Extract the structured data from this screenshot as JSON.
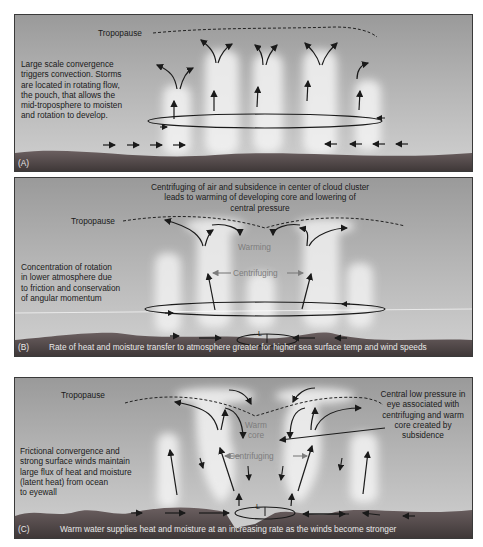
{
  "figure": {
    "colors": {
      "sky_top": "#9a9a9a",
      "sky_bottom": "#cfcfcf",
      "ocean": "#5a5050",
      "cloud": "#f2f2f2",
      "arrow": "#1a1a1a",
      "grey_label": "#7d7d7d",
      "caption_text": "#e8e8e8"
    }
  },
  "panels": [
    {
      "id": "A",
      "label": "(A)",
      "tropopause_label": "Tropopause",
      "description": "Large scale convergence\ntriggers convection. Storms\nare located in rotating flow,\nthe pouch, that allows the\nmid-troposphere to moisten\nand rotation to develop.",
      "caption": ""
    },
    {
      "id": "B",
      "label": "(B)",
      "tropopause_label": "Tropopause",
      "top_note": "Centrifuging of air and subsidence in center of cloud cluster\nleads to warming of developing core and lowering of\ncentral pressure",
      "description": "Concentration of rotation\nin lower atmosphere due\nto friction and conservation\nof angular momentum",
      "inner_labels": {
        "warming": "Warming",
        "centrifuging": "Centrifuging",
        "low": "L"
      },
      "caption": "Rate of heat and moisture transfer to atmosphere greater for higher sea surface temp and wind speeds"
    },
    {
      "id": "C",
      "label": "(C)",
      "tropopause_label": "Tropopause",
      "right_note": "Central low pressure in\neye associated with\ncentrifuging and warm\ncore created by\nsubsidence",
      "description": "Frictional convergence and\nstrong surface winds maintain\nlarge flux of heat and moisture\n(latent heat) from ocean\nto eyewall",
      "inner_labels": {
        "warm_core": "Warm\ncore",
        "centrifuging": "Centrifuging",
        "low": "L"
      },
      "caption": "Warm water supplies heat and moisture at an increasing rate as the winds become stronger"
    }
  ]
}
